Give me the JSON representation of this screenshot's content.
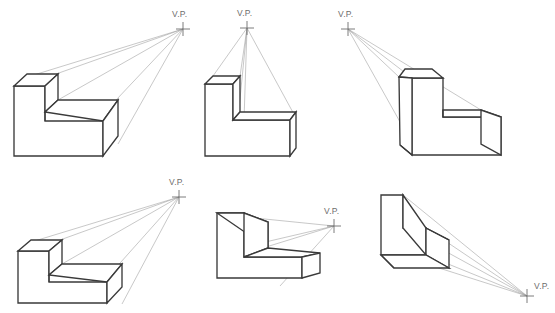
{
  "page": {
    "background_color": "#ffffff",
    "width": 555,
    "height": 313
  },
  "colors": {
    "outline": "#3a3a3a",
    "ray": "#9a9a9a",
    "label_text": "#6d6d6d",
    "face_fill": "#ffffff"
  },
  "labels": {
    "vp": "V.P."
  },
  "figures": [
    {
      "id": "figure-1",
      "name": "l-block-vp-upper-right",
      "position": "top-left",
      "vp_label": "V.P.",
      "vp_x": 183,
      "vp_y": 29,
      "ray_count": 5
    },
    {
      "id": "figure-2",
      "name": "l-block-vp-above",
      "position": "top-center",
      "vp_label": "V.P.",
      "vp_x": 247,
      "vp_y": 28,
      "ray_count": 5
    },
    {
      "id": "figure-3",
      "name": "l-block-vp-upper-left",
      "position": "top-right",
      "vp_label": "V.P.",
      "vp_x": 348,
      "vp_y": 29,
      "ray_count": 4
    },
    {
      "id": "figure-4",
      "name": "l-block-vp-upper-right-low",
      "position": "bottom-left",
      "vp_label": "V.P.",
      "vp_x": 179,
      "vp_y": 197,
      "ray_count": 5
    },
    {
      "id": "figure-5",
      "name": "l-block-vp-right",
      "position": "bottom-center",
      "vp_label": "V.P.",
      "vp_x": 334,
      "vp_y": 226,
      "ray_count": 4
    },
    {
      "id": "figure-6",
      "name": "l-block-vp-lower-right",
      "position": "bottom-right",
      "vp_label": "V.P.",
      "vp_x": 527,
      "vp_y": 296,
      "ray_count": 5
    }
  ]
}
